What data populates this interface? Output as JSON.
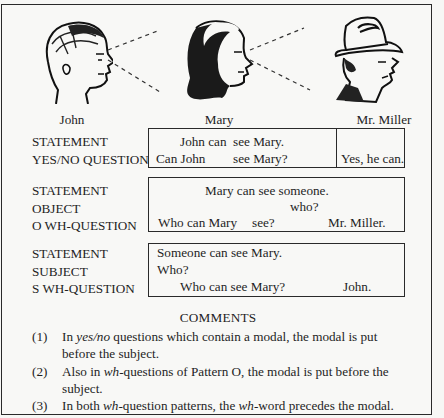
{
  "figure": {
    "characters": [
      {
        "name": "John",
        "icon": "man-head-profile-icon"
      },
      {
        "name": "Mary",
        "icon": "woman-head-profile-icon"
      },
      {
        "name": "Mr. Miller",
        "icon": "man-with-hat-profile-icon"
      }
    ],
    "sight_lines": "dashed lines from John to Mary and from Mary to Mr. Miller"
  },
  "patterns": [
    {
      "labels": [
        "STATEMENT",
        "YES/NO QUESTION"
      ],
      "statement": {
        "subject_modal": "John can",
        "rest": "see Mary."
      },
      "question": {
        "modal_subject": "Can John",
        "rest": "see Mary?"
      },
      "answer": "Yes, he can."
    },
    {
      "labels": [
        "STATEMENT",
        "OBJECT",
        "O WH-QUESTION"
      ],
      "statement": "Mary can see someone.",
      "wh_word": "who?",
      "question": {
        "part1": "Who can Mary",
        "part2": "see?"
      },
      "answer": "Mr. Miller."
    },
    {
      "labels": [
        "STATEMENT",
        "SUBJECT",
        "S WH-QUESTION"
      ],
      "statement": "Someone can see Mary.",
      "wh_word": "Who?",
      "question": {
        "part1": "Who",
        "part2": "can see Mary?"
      },
      "answer": "John."
    }
  ],
  "comments": {
    "title": "COMMENTS",
    "items": [
      {
        "num": "(1)",
        "pre": "In ",
        "em": "yes/no",
        "post": " questions which contain a modal, the modal is put before the subject."
      },
      {
        "num": "(2)",
        "pre": "Also in ",
        "em": "wh",
        "post": "-questions of Pattern O, the modal is put before the subject."
      },
      {
        "num": "(3)",
        "pre": "In both ",
        "em": "wh",
        "mid": "-question patterns, the ",
        "em2": "wh",
        "post": "-word precedes the modal."
      }
    ]
  }
}
